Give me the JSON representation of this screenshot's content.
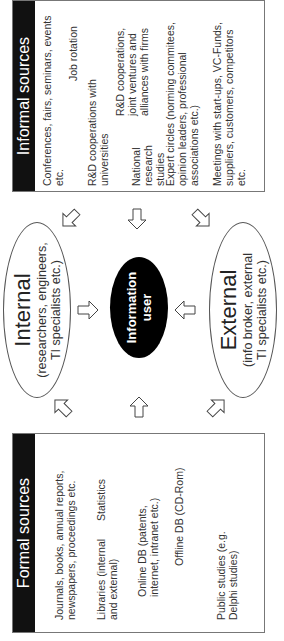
{
  "formal": {
    "title": "Formal sources",
    "items": [
      {
        "l1": "Journals, books, annual reports,",
        "l2": "newspapers, proceedings etc."
      },
      {
        "l1": "Libraries (internal",
        "l2": "and external)"
      },
      {
        "l1": "Statistics"
      },
      {
        "l1": "Online DB (patents,",
        "l2": "internet, intranet etc.)"
      },
      {
        "l1": "Offline DB (CD-Rom)"
      },
      {
        "l1": "Public studies (e.g.",
        "l2": "Delphi studies)"
      }
    ]
  },
  "informal": {
    "title": "Informal sources",
    "items": [
      {
        "l1": "Conferences, fairs, seminars, events",
        "l2": "etc."
      },
      {
        "l1": "Job rotation"
      },
      {
        "l1": "R&D cooperations with",
        "l2": "universities"
      },
      {
        "l1": "R&D cooperations,",
        "l2": "joint ventures and",
        "l3": "alliances  with firms"
      },
      {
        "l1": "National",
        "l2": "research",
        "l3": "studies"
      },
      {
        "l1": "Expert circles (norming commitees,",
        "l2": "opinion leaders, professional",
        "l3": "associations etc.)"
      },
      {
        "l1": "Meetings with start-ups, VC-Funds,",
        "l2": "suppliers, customers, competitors",
        "l3": "etc."
      }
    ]
  },
  "internal": {
    "title": "Internal",
    "l1": "(researchers, engineers,",
    "l2": "TI specialists etc.)"
  },
  "external": {
    "title": "External",
    "l1": "(info broker, external",
    "l2": "TI specialists etc.)"
  },
  "center": {
    "l1": "Information",
    "l2": "user"
  },
  "arrows": [
    "arrow-formal-to-internal",
    "arrow-formal-to-center",
    "arrow-formal-to-external",
    "arrow-internal-to-center",
    "arrow-external-to-center",
    "arrow-informal-to-internal",
    "arrow-informal-to-center",
    "arrow-informal-to-external"
  ]
}
